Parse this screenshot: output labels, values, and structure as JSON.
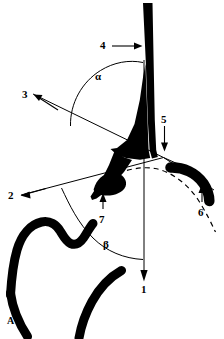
{
  "figure": {
    "panel_letter": "A",
    "background_color": "#ffffff",
    "ink_color": "#000000",
    "width": 224,
    "height": 339,
    "type": "line-drawing-anatomical-diagram"
  },
  "labels": [
    {
      "id": "label-1",
      "text": "1",
      "x": 141,
      "y": 284,
      "kind": "numeric",
      "leader": "vertical-line-with-down-arrow",
      "points_to": "vertical-reference-axis"
    },
    {
      "id": "label-2",
      "text": "2",
      "x": 8,
      "y": 190,
      "kind": "numeric",
      "leader": "left-arrow",
      "points_to": "lower-oblique-reference-line"
    },
    {
      "id": "label-3",
      "text": "3",
      "x": 22,
      "y": 89,
      "kind": "numeric",
      "leader": "up-left-arrow",
      "points_to": "upper-oblique-reference-line"
    },
    {
      "id": "label-4",
      "text": "4",
      "x": 100,
      "y": 42,
      "kind": "numeric",
      "leader": "right-arrow",
      "points_to": "vertical-black-shaft"
    },
    {
      "id": "label-5",
      "text": "5",
      "x": 161,
      "y": 114,
      "kind": "numeric",
      "leader": "down-arrow",
      "points_to": "pivot-circle"
    },
    {
      "id": "label-6",
      "text": "6",
      "x": 198,
      "y": 207,
      "kind": "numeric",
      "leader": "up-arrow",
      "points_to": "curved-black-rod-tip"
    },
    {
      "id": "label-7",
      "text": "7",
      "x": 99,
      "y": 214,
      "kind": "numeric",
      "leader": "up-arrow",
      "points_to": "black-bulb-process"
    },
    {
      "id": "label-alpha",
      "text": "α",
      "x": 95,
      "y": 71,
      "kind": "greek",
      "leader": "arc",
      "points_to": "angle-alpha-arc"
    },
    {
      "id": "label-beta",
      "text": "β",
      "x": 103,
      "y": 239,
      "kind": "greek",
      "leader": "arc",
      "points_to": "angle-beta-arc"
    },
    {
      "id": "label-panel",
      "text": "A",
      "x": 7,
      "y": 316,
      "kind": "panel",
      "leader": "none",
      "points_to": "panel-identifier"
    }
  ],
  "geometry": {
    "pivot_circle": {
      "cx": 163.5,
      "cy": 157.5,
      "r": 3.4
    },
    "vertical_axis": {
      "x": 144,
      "y_top": 60,
      "y_bottom": 281
    },
    "angle_alpha_arc": {
      "description": "arc from upper-oblique line to vertical shaft"
    },
    "angle_beta_arc": {
      "description": "arc from lower-oblique line to vertical axis"
    }
  },
  "strokes": {
    "thin_line_width": 1.0,
    "dashed_pattern": "5 4",
    "outline_width": 9
  }
}
